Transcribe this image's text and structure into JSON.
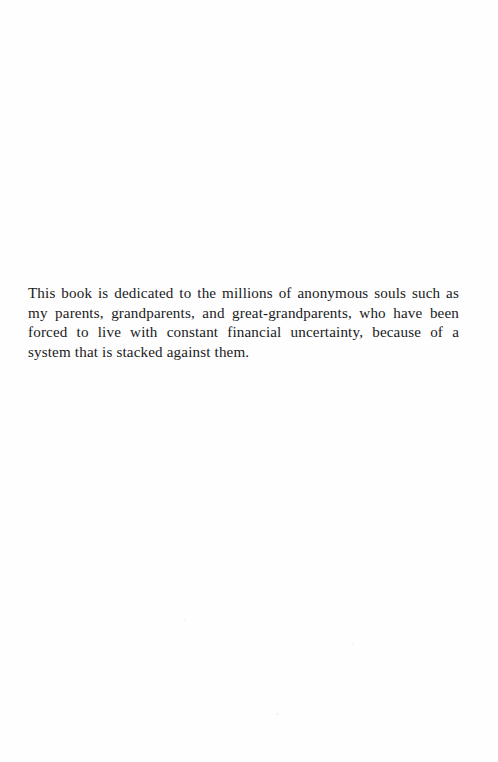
{
  "page": {
    "kind": "book-dedication-page",
    "background_color": "#fefefe",
    "ink_color": "#1a1a1c",
    "width": 498,
    "height": 762
  },
  "dedication": {
    "text": "This book is dedicated to the millions of anonymous souls such as my parents, grandparents, and great-grandparents, who have been forced to live with constant financial uncertainty, because of a system that is stacked against them.",
    "lines": [
      "This book is dedicated to the millions of anonymous souls such as my",
      "parents, grandparents, and great-grandparents, who have been forced",
      "to live with constant financial uncertainty, because of a system that is",
      "stacked against them."
    ],
    "alignment": "justify",
    "line_count": 4
  }
}
